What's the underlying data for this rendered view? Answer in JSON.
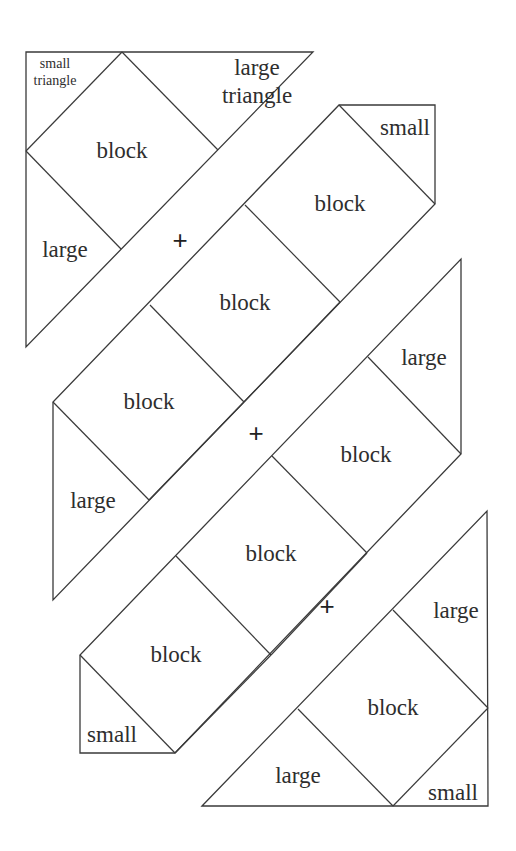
{
  "diagram": {
    "title": "",
    "stroke_color": "#3a3a3a",
    "text_color": "#2e2e2e",
    "background": "#ffffff",
    "pieces": [
      {
        "id": "row-1",
        "outline": [
          [
            26,
            52
          ],
          [
            313,
            52
          ],
          [
            26,
            347
          ]
        ],
        "seams": [
          [
            [
              122,
              52
            ],
            [
              26,
              151
            ]
          ],
          [
            [
              122,
              52
            ],
            [
              218,
              150
            ]
          ],
          [
            [
              26,
              151
            ],
            [
              121,
              249
            ]
          ]
        ],
        "labels": [
          {
            "text": "small",
            "x": 55,
            "y": 63,
            "size": 14
          },
          {
            "text": "triangle",
            "x": 55,
            "y": 80,
            "size": 14
          },
          {
            "text": "large",
            "x": 257,
            "y": 67,
            "size": 23
          },
          {
            "text": "triangle",
            "x": 257,
            "y": 95,
            "size": 23
          },
          {
            "text": "block",
            "x": 122,
            "y": 150,
            "size": 23
          },
          {
            "text": "large",
            "x": 65,
            "y": 249,
            "size": 23
          }
        ]
      },
      {
        "id": "row-2",
        "outline": [
          [
            53,
            600
          ],
          [
            53,
            402
          ],
          [
            339,
            105
          ],
          [
            435,
            105
          ],
          [
            435,
            204
          ]
        ],
        "seams": [
          [
            [
              53,
              402
            ],
            [
              149,
              500
            ]
          ],
          [
            [
              150,
              305
            ],
            [
              244,
              402
            ]
          ],
          [
            [
              245,
              205
            ],
            [
              340,
              302
            ]
          ],
          [
            [
              339,
              105
            ],
            [
              435,
              204
            ]
          ],
          [
            [
              244,
              402
            ],
            [
              149,
              500
            ]
          ],
          [
            [
              340,
              302
            ],
            [
              244,
              402
            ]
          ]
        ],
        "labels": [
          {
            "text": "small",
            "x": 405,
            "y": 127,
            "size": 23
          },
          {
            "text": "block",
            "x": 340,
            "y": 203,
            "size": 23
          },
          {
            "text": "block",
            "x": 245,
            "y": 302,
            "size": 23
          },
          {
            "text": "block",
            "x": 149,
            "y": 401,
            "size": 23
          },
          {
            "text": "large",
            "x": 93,
            "y": 500,
            "size": 23
          }
        ]
      },
      {
        "id": "row-3",
        "outline": [
          [
            80,
            753
          ],
          [
            80,
            655
          ],
          [
            461,
            259
          ],
          [
            461,
            454
          ],
          [
            175,
            753
          ]
        ],
        "seams": [
          [
            [
              80,
              655
            ],
            [
              175,
              753
            ]
          ],
          [
            [
              176,
              556
            ],
            [
              271,
              655
            ]
          ],
          [
            [
              272,
              456
            ],
            [
              367,
              553
            ]
          ],
          [
            [
              368,
              357
            ],
            [
              461,
              454
            ]
          ],
          [
            [
              367,
              553
            ],
            [
              271,
              655
            ]
          ],
          [
            [
              271,
              655
            ],
            [
              175,
              753
            ]
          ]
        ],
        "labels": [
          {
            "text": "large",
            "x": 424,
            "y": 357,
            "size": 23
          },
          {
            "text": "block",
            "x": 366,
            "y": 454,
            "size": 23
          },
          {
            "text": "block",
            "x": 271,
            "y": 553,
            "size": 23
          },
          {
            "text": "block",
            "x": 176,
            "y": 654,
            "size": 23
          },
          {
            "text": "small",
            "x": 112,
            "y": 734,
            "size": 23
          }
        ]
      },
      {
        "id": "row-4",
        "outline": [
          [
            202,
            806
          ],
          [
            487,
            511
          ],
          [
            488,
            806
          ]
        ],
        "seams": [
          [
            [
              298,
              709
            ],
            [
              393,
              806
            ]
          ],
          [
            [
              393,
              610
            ],
            [
              488,
              708
            ]
          ],
          [
            [
              488,
              708
            ],
            [
              393,
              806
            ]
          ]
        ],
        "labels": [
          {
            "text": "large",
            "x": 456,
            "y": 610,
            "size": 23
          },
          {
            "text": "block",
            "x": 393,
            "y": 707,
            "size": 23
          },
          {
            "text": "large",
            "x": 298,
            "y": 775,
            "size": 23
          },
          {
            "text": "small",
            "x": 453,
            "y": 792,
            "size": 23
          }
        ]
      }
    ],
    "joins": [
      {
        "symbol": "+",
        "x": 180,
        "y": 240,
        "size": 26
      },
      {
        "symbol": "+",
        "x": 256,
        "y": 433,
        "size": 26
      },
      {
        "symbol": "+",
        "x": 327,
        "y": 606,
        "size": 26
      }
    ]
  }
}
